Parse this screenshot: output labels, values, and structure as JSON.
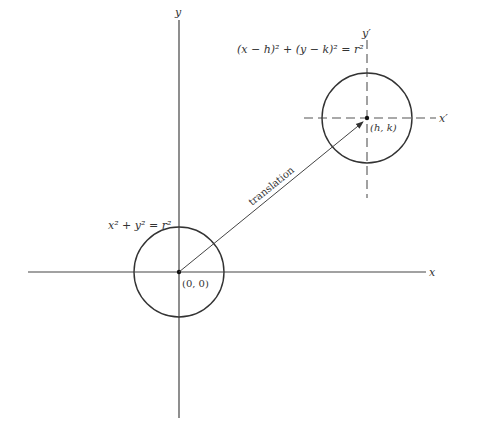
{
  "diagram": {
    "axes": {
      "x_label": "x",
      "y_label": "y"
    },
    "translated_axes": {
      "x_label": "x′",
      "y_label": "y′"
    },
    "origin_circle": {
      "equation": "x² + y² = r²",
      "center_label": "(0, 0)"
    },
    "translated_circle": {
      "equation": "(x − h)² + (y − k)² = r²",
      "center_label": "(h, k)"
    },
    "arrow": {
      "label": "translation"
    },
    "colors": {
      "line": "#333333",
      "dashed": "#555555",
      "background": "#ffffff"
    }
  }
}
